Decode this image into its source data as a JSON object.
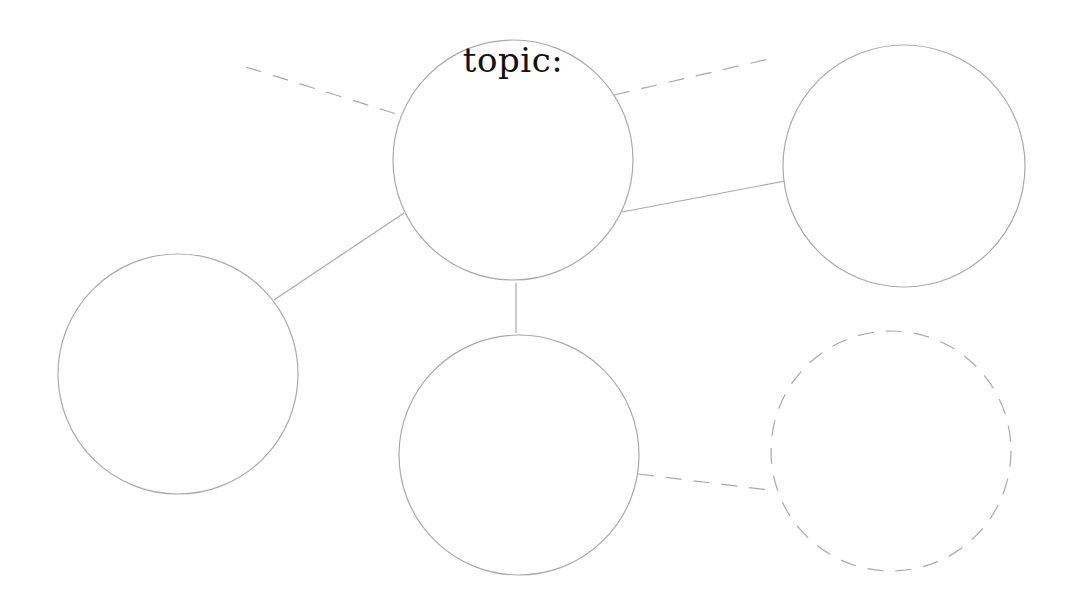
{
  "diagram": {
    "type": "bubble-map",
    "colors": {
      "stroke": "#a9a9a9",
      "text": "#111111",
      "background": "#ffffff"
    },
    "center_node": {
      "label": "topic:",
      "cx": 513,
      "cy": 160,
      "r": 120,
      "style": "solid"
    },
    "nodes": [
      {
        "id": "right",
        "label": "",
        "cx": 904,
        "cy": 166,
        "r": 121,
        "style": "solid"
      },
      {
        "id": "left",
        "label": "",
        "cx": 178,
        "cy": 374,
        "r": 120,
        "style": "solid"
      },
      {
        "id": "bottom",
        "label": "",
        "cx": 519,
        "cy": 455,
        "r": 120,
        "style": "solid"
      },
      {
        "id": "bottom-right",
        "label": "",
        "cx": 891,
        "cy": 451,
        "r": 120,
        "style": "dashed"
      }
    ],
    "edges": [
      {
        "from": "center",
        "to": "offscreen-top-left",
        "style": "dashed",
        "x1": 246,
        "y1": 67,
        "x2": 403,
        "y2": 116
      },
      {
        "from": "center",
        "to": "offscreen-top-right",
        "style": "dashed",
        "x1": 614,
        "y1": 95,
        "x2": 777,
        "y2": 57
      },
      {
        "from": "center",
        "to": "right",
        "style": "solid",
        "x1": 622,
        "y1": 212,
        "x2": 785,
        "y2": 181
      },
      {
        "from": "center",
        "to": "left",
        "style": "solid",
        "x1": 404,
        "y1": 213,
        "x2": 274,
        "y2": 300
      },
      {
        "from": "center",
        "to": "bottom",
        "style": "solid",
        "x1": 516,
        "y1": 283,
        "x2": 516,
        "y2": 333
      },
      {
        "from": "bottom",
        "to": "bottom-right",
        "style": "dashed",
        "x1": 638,
        "y1": 474,
        "x2": 777,
        "y2": 491
      }
    ]
  }
}
